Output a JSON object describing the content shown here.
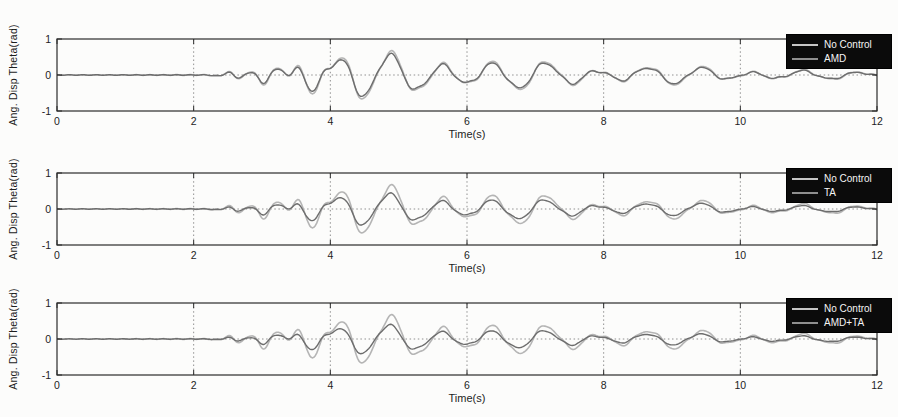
{
  "figure": {
    "kind": "scanned MATLAB figure, 3 stacked time-history subplots",
    "background": "#fcfcfb",
    "axis_color": "#2b2b2b",
    "grid_color": "#909090",
    "tick_label_color": "#1d1d1d"
  },
  "chart_data": {
    "type": "line",
    "layout": "3 vertically stacked subplots with identical axes; each compares the uncontrolled response with one control case",
    "xlabel": "Time(s)",
    "ylabel": "Ang. Disp Theta(rad)",
    "xlim": [
      0,
      12
    ],
    "ylim": [
      -1,
      1
    ],
    "xticks": [
      0,
      2,
      4,
      6,
      8,
      10,
      12
    ],
    "yticks": [
      -1,
      0,
      1
    ],
    "grid": {
      "vertical_dotted_at": [
        2,
        4,
        6,
        8,
        10
      ],
      "horizontal_dotted_at": [
        0
      ],
      "style": "dotted"
    },
    "charts": [
      {
        "name": "amd",
        "xlabel": "Time(s)",
        "ylabel": "Ang. Disp Theta(rad)",
        "legend": {
          "position": "top-right",
          "background": "#0b0b0b",
          "text_color": "#f5f5f5",
          "entries": [
            {
              "label": "No Control",
              "color": "#c6c6c6"
            },
            {
              "label": "AMD",
              "color": "#8f8f8f"
            }
          ]
        },
        "series": [
          {
            "name": "No Control",
            "color": "#b5b5b5",
            "component_scales": [
              1,
              1,
              1,
              1
            ],
            "phase_shift": 0
          },
          {
            "name": "AMD",
            "color": "#6d6d6d",
            "component_scales": [
              0.9,
              0.82,
              0.9,
              0.85
            ],
            "phase_shift": 0.06
          }
        ]
      },
      {
        "name": "ta",
        "xlabel": "Time(s)",
        "ylabel": "Ang. Disp Theta(rad)",
        "legend": {
          "position": "top-right",
          "background": "#0b0b0b",
          "text_color": "#f5f5f5",
          "entries": [
            {
              "label": "No Control",
              "color": "#c6c6c6"
            },
            {
              "label": "TA",
              "color": "#8f8f8f"
            }
          ]
        },
        "series": [
          {
            "name": "No Control",
            "color": "#b5b5b5",
            "component_scales": [
              1,
              1,
              1,
              1
            ],
            "phase_shift": 0
          },
          {
            "name": "TA",
            "color": "#6d6d6d",
            "component_scales": [
              0.68,
              0.55,
              0.7,
              0.6
            ],
            "phase_shift": 0.14
          }
        ]
      },
      {
        "name": "amd-ta",
        "xlabel": "Time(s)",
        "ylabel": "Ang. Disp Theta(rad)",
        "legend": {
          "position": "top-right",
          "background": "#0b0b0b",
          "text_color": "#f5f5f5",
          "entries": [
            {
              "label": "No Control",
              "color": "#c6c6c6"
            },
            {
              "label": "AMD+TA",
              "color": "#8f8f8f"
            }
          ]
        },
        "series": [
          {
            "name": "No Control",
            "color": "#b5b5b5",
            "component_scales": [
              1,
              1,
              1,
              1
            ],
            "phase_shift": 0
          },
          {
            "name": "AMD+TA",
            "color": "#6d6d6d",
            "component_scales": [
              0.62,
              0.5,
              0.65,
              0.55
            ],
            "phase_shift": 0.16
          }
        ]
      }
    ],
    "signal_model": {
      "note": "Seismic-type angular displacement response read from the figure: flat near 0 until about t=2.2 s, growing high-frequency oscillations 2.2-4 s, peak of about 0.65 rad near t=4.4 s, slowly decaying oscillation (period about 0.75 s) out to 12 s. Controlled responses are scaled-down versions of the uncontrolled one.",
      "sample_step_s": 0.02,
      "components": [
        {
          "freq_hz": 1.32,
          "phase_rad": -1.2,
          "envelope": [
            [
              0,
              0
            ],
            [
              2.6,
              0
            ],
            [
              3.0,
              0.1
            ],
            [
              3.5,
              0.2
            ],
            [
              3.9,
              0.4
            ],
            [
              4.3,
              0.6
            ],
            [
              4.9,
              0.55
            ],
            [
              5.4,
              0.38
            ],
            [
              6.0,
              0.33
            ],
            [
              6.6,
              0.35
            ],
            [
              7.3,
              0.3
            ],
            [
              8.0,
              0.18
            ],
            [
              8.7,
              0.2
            ],
            [
              9.4,
              0.21
            ],
            [
              10.0,
              0.12
            ],
            [
              10.8,
              0.1
            ],
            [
              11.5,
              0.08
            ],
            [
              12,
              0.07
            ]
          ]
        },
        {
          "freq_hz": 2.85,
          "phase_rad": 0.8,
          "envelope": [
            [
              0,
              0
            ],
            [
              2.2,
              0
            ],
            [
              2.45,
              0.07
            ],
            [
              2.8,
              0.13
            ],
            [
              3.1,
              0.16
            ],
            [
              3.45,
              0.2
            ],
            [
              3.7,
              0.24
            ],
            [
              3.95,
              0.16
            ],
            [
              4.3,
              0.09
            ],
            [
              5.0,
              0.06
            ],
            [
              6.0,
              0.05
            ],
            [
              7.0,
              0.045
            ],
            [
              8.0,
              0.04
            ],
            [
              9.5,
              0.03
            ],
            [
              11,
              0.025
            ],
            [
              12,
              0.02
            ]
          ]
        },
        {
          "freq_hz": 5.1,
          "phase_rad": 2.0,
          "envelope": [
            [
              0,
              0.008
            ],
            [
              2.1,
              0.01
            ],
            [
              2.5,
              0.025
            ],
            [
              3.2,
              0.03
            ],
            [
              4.0,
              0.025
            ],
            [
              5,
              0.02
            ],
            [
              7,
              0.015
            ],
            [
              9,
              0.012
            ],
            [
              12,
              0.01
            ]
          ]
        },
        {
          "freq_hz": 0.85,
          "phase_rad": 0.4,
          "envelope": [
            [
              0,
              0
            ],
            [
              4.0,
              0
            ],
            [
              4.6,
              0.08
            ],
            [
              5.5,
              0.1
            ],
            [
              6.5,
              0.08
            ],
            [
              8,
              0.07
            ],
            [
              9.5,
              0.05
            ],
            [
              11,
              0.04
            ],
            [
              12,
              0.03
            ]
          ]
        }
      ]
    }
  }
}
